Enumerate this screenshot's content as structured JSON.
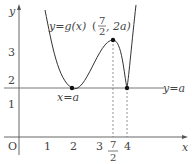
{
  "diagram": {
    "axes": {
      "x_label": "x",
      "y_label": "y",
      "origin_label": "O",
      "x_ticks": [
        "1",
        "2",
        "3",
        "4"
      ],
      "x_frac_tick": {
        "num": "7",
        "den": "2"
      },
      "y_ticks": [
        "1",
        "2",
        "3"
      ]
    },
    "curve_label": "y=g(x)",
    "max_point_label": {
      "open": "(",
      "num": "7",
      "den": "2",
      "rest": ", 2a)"
    },
    "min_label": "x=a",
    "line_label": "y=a",
    "colors": {
      "curve": "#333333",
      "axis": "#555555",
      "dashed": "#777777",
      "line": "#666666"
    }
  }
}
